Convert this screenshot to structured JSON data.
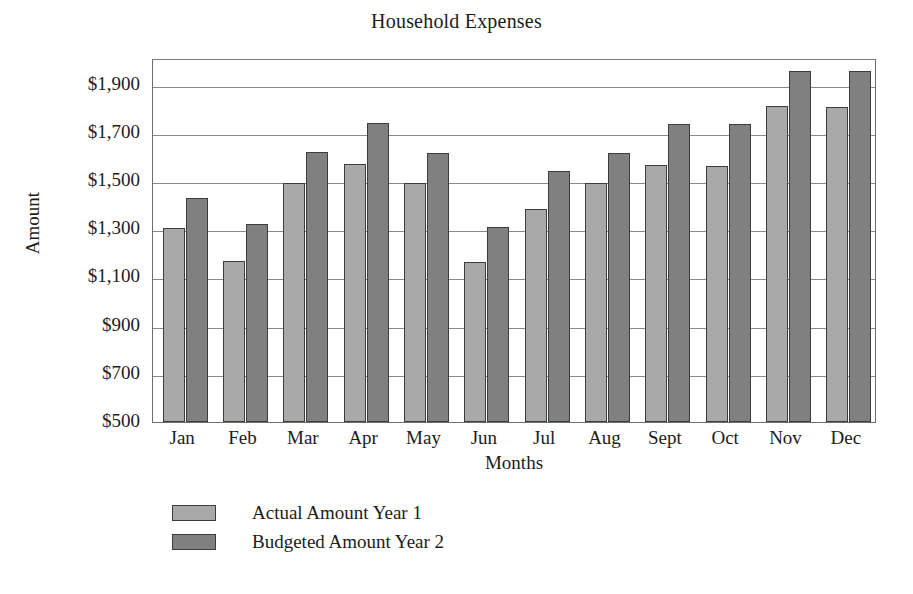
{
  "chart_data": {
    "type": "bar",
    "title": "Household Expenses",
    "xlabel": "Months",
    "ylabel": "Amount",
    "categories": [
      "Jan",
      "Feb",
      "Mar",
      "Apr",
      "May",
      "Jun",
      "Jul",
      "Aug",
      "Sept",
      "Oct",
      "Nov",
      "Dec"
    ],
    "series": [
      {
        "name": "Actual Amount Year 1",
        "color": "#a9a9a9",
        "values": [
          1305,
          1170,
          1490,
          1570,
          1490,
          1165,
          1385,
          1490,
          1565,
          1560,
          1810,
          1805
        ]
      },
      {
        "name": "Budgeted Amount Year 2",
        "color": "#808080",
        "values": [
          1430,
          1320,
          1620,
          1740,
          1615,
          1310,
          1540,
          1615,
          1735,
          1735,
          1955,
          1955
        ]
      }
    ],
    "ylim": [
      500,
      2010
    ],
    "ytick_values": [
      500,
      700,
      900,
      1100,
      1300,
      1500,
      1700,
      1900
    ],
    "ytick_labels": [
      "$500",
      "$700",
      "$900",
      "$1,100",
      "$1,300",
      "$1,500",
      "$1,700",
      "$1,900"
    ],
    "grid": true,
    "legend_position": "bottom-left",
    "legend": [
      "Actual Amount Year 1",
      "Budgeted Amount Year 2"
    ]
  }
}
